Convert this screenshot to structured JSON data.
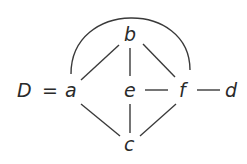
{
  "graph": {
    "name": "D",
    "equals": "=",
    "nodes": [
      {
        "id": "a",
        "label": "a",
        "x": 70,
        "y": 97
      },
      {
        "id": "b",
        "label": "b",
        "x": 130,
        "y": 41
      },
      {
        "id": "e",
        "label": "e",
        "x": 130,
        "y": 97
      },
      {
        "id": "f",
        "label": "f",
        "x": 183,
        "y": 97
      },
      {
        "id": "d",
        "label": "d",
        "x": 232,
        "y": 97
      },
      {
        "id": "c",
        "label": "c",
        "x": 130,
        "y": 150
      }
    ],
    "edges": [
      {
        "from": "a",
        "to": "b",
        "type": "line"
      },
      {
        "from": "b",
        "to": "e",
        "type": "line"
      },
      {
        "from": "b",
        "to": "f",
        "type": "line"
      },
      {
        "from": "e",
        "to": "f",
        "type": "line"
      },
      {
        "from": "f",
        "to": "d",
        "type": "line"
      },
      {
        "from": "a",
        "to": "c",
        "type": "line"
      },
      {
        "from": "e",
        "to": "c",
        "type": "line"
      },
      {
        "from": "f",
        "to": "c",
        "type": "line"
      },
      {
        "from": "a",
        "to": "f",
        "type": "arc"
      }
    ]
  }
}
